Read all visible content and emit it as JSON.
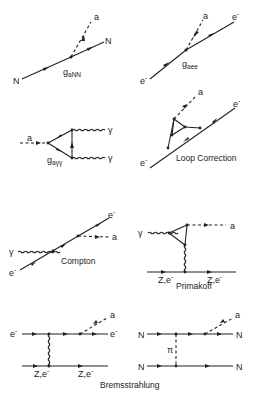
{
  "diagrams": {
    "axion_nucleon": {
      "particles": {
        "in": "N",
        "out": "N",
        "axion": "a"
      },
      "coupling": "g",
      "coupling_sub": "aNN"
    },
    "axion_electron": {
      "particles": {
        "in": "e",
        "out": "e",
        "axion": "a"
      },
      "sup": "-",
      "coupling": "g",
      "coupling_sub": "aee"
    },
    "axion_photon": {
      "particles": {
        "axion": "a",
        "photon1": "γ",
        "photon2": "γ"
      },
      "coupling": "g",
      "coupling_sub": "aγγ"
    },
    "loop_correction": {
      "particles": {
        "in": "e",
        "out": "e",
        "axion": "a"
      },
      "sup": "-",
      "caption": "Loop Correction"
    },
    "compton": {
      "particles": {
        "photon": "γ",
        "in": "e",
        "out": "e",
        "axion": "a"
      },
      "sup": "-",
      "caption": "Compton"
    },
    "primakoff": {
      "particles": {
        "photon": "γ",
        "axion": "a",
        "target_in": "Z,e",
        "target_out": "Z,e"
      },
      "sup": "-",
      "caption": "Primakoff"
    },
    "bremsstrahlung_electron": {
      "particles": {
        "in": "e",
        "out": "e",
        "axion": "a",
        "target_in": "Z,e",
        "target_out": "Z,e"
      },
      "sup": "-"
    },
    "bremsstrahlung_nucleon": {
      "particles": {
        "n1_in": "N",
        "n1_out": "N",
        "n2_in": "N",
        "n2_out": "N",
        "axion": "a",
        "exchange": "π"
      }
    },
    "bremsstrahlung_caption": "Bremsstrahlung"
  }
}
